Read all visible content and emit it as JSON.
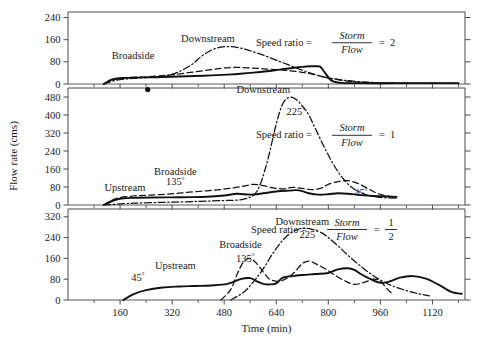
{
  "figure": {
    "y_axis_title": "Flow rate (cms)",
    "x_axis_title": "Time (min)"
  },
  "chart_data": {
    "type": "line",
    "title": "",
    "xlabel": "Time (min)",
    "ylabel": "Flow rate (cms)",
    "xlim": [
      0,
      1220
    ],
    "x_ticks_major": [
      160,
      320,
      480,
      640,
      800,
      960,
      1120
    ],
    "x_ticks_major_labels": [
      "160",
      "320",
      "480",
      "640",
      "800",
      "960",
      "1120"
    ],
    "x_ticks_minor": [
      80,
      240,
      400,
      560,
      720,
      880,
      1040,
      1200
    ],
    "grid": false,
    "legend": "inline-curve-labels",
    "line_styles": {
      "upstream": "solid",
      "broadside": "dashed",
      "downstream": "dash-dot"
    },
    "panels": [
      {
        "id": "panel-top",
        "annotation_prefix": "Speed ratio = ",
        "annotation_numerator": "Storm",
        "annotation_denominator": "Flow",
        "annotation_equals": "=",
        "annotation_value": "2",
        "annotation_value_is_fraction": false,
        "ylim": [
          0,
          260
        ],
        "y_ticks": [
          0,
          80,
          160,
          240
        ],
        "y_tick_labels": [
          "0",
          "80",
          "160",
          "240"
        ],
        "curve_labels": [
          {
            "text": "Broadside",
            "x": 200,
            "y": 92
          },
          {
            "text": "Downstream",
            "x": 430,
            "y": 150
          }
        ],
        "angle_labels": [],
        "series": [
          {
            "name": "Upstream",
            "style": "solid",
            "x": [
              110,
              130,
              150,
              175,
              200,
              240,
              290,
              340,
              390,
              440,
              490,
              530,
              570,
              610,
              650,
              690,
              720,
              745,
              760,
              775,
              790,
              810,
              840,
              900,
              1000,
              1100,
              1200
            ],
            "values": [
              0,
              14,
              20,
              22,
              23,
              24,
              25,
              27,
              29,
              31,
              34,
              37,
              41,
              46,
              52,
              58,
              62,
              64,
              64,
              62,
              40,
              12,
              4,
              3,
              3,
              3,
              3
            ]
          },
          {
            "name": "Broadside",
            "style": "dashed",
            "x": [
              110,
              140,
              170,
              200,
              240,
              290,
              340,
              390,
              440,
              480,
              520,
              560,
              600,
              640,
              680,
              720,
              760,
              800,
              850,
              900,
              980,
              1080,
              1200
            ],
            "values": [
              0,
              16,
              22,
              24,
              26,
              30,
              36,
              44,
              52,
              58,
              60,
              58,
              55,
              52,
              48,
              42,
              33,
              22,
              12,
              6,
              3,
              2,
              2
            ]
          },
          {
            "name": "Downstream",
            "style": "dash-dot",
            "x": [
              110,
              150,
              200,
              250,
              300,
              340,
              380,
              410,
              440,
              470,
              500,
              530,
              560,
              600,
              640,
              680,
              720,
              760,
              800,
              860,
              930,
              1020,
              1120,
              1200
            ],
            "values": [
              0,
              14,
              20,
              24,
              30,
              44,
              70,
              100,
              122,
              133,
              135,
              130,
              120,
              104,
              86,
              68,
              50,
              34,
              22,
              12,
              6,
              3,
              2,
              2
            ]
          }
        ]
      },
      {
        "id": "panel-middle",
        "annotation_prefix": "Speed ratio = ",
        "annotation_numerator": "Storm",
        "annotation_denominator": "Flow",
        "annotation_equals": "=",
        "annotation_value": "1",
        "annotation_value_is_fraction": false,
        "ylim": [
          0,
          520
        ],
        "y_ticks": [
          0,
          80,
          160,
          240,
          320,
          400,
          480
        ],
        "y_tick_labels": [
          "0",
          "80",
          "160",
          "240",
          "320",
          "400",
          "480"
        ],
        "curve_labels": [
          {
            "text": "Upstream",
            "x": 175,
            "y": 62
          },
          {
            "text": "Broadside",
            "x": 330,
            "y": 132
          },
          {
            "text": "Downstream",
            "x": 600,
            "y": 500
          }
        ],
        "angle_labels": [
          {
            "text": "135",
            "x": 330,
            "y": 88
          },
          {
            "text": "225",
            "x": 700,
            "y": 400
          },
          {
            "text": "45",
            "x": 900,
            "y": 40
          }
        ],
        "series": [
          {
            "name": "Upstream",
            "style": "solid",
            "x": [
              110,
              140,
              170,
              210,
              260,
              320,
              380,
              440,
              480,
              520,
              560,
              600,
              640,
              680,
              700,
              720,
              740,
              770,
              800,
              830,
              860,
              900,
              940,
              980,
              1010
            ],
            "values": [
              0,
              20,
              30,
              32,
              33,
              34,
              35,
              38,
              42,
              50,
              46,
              52,
              60,
              64,
              66,
              62,
              52,
              46,
              48,
              52,
              50,
              44,
              40,
              38,
              36
            ]
          },
          {
            "name": "Broadside",
            "style": "dashed",
            "x": [
              110,
              150,
              200,
              250,
              300,
              350,
              400,
              450,
              500,
              540,
              570,
              600,
              630,
              660,
              690,
              720,
              750,
              780,
              800,
              830,
              860,
              890,
              920,
              950,
              980,
              1010
            ],
            "values": [
              0,
              30,
              40,
              44,
              48,
              54,
              60,
              66,
              74,
              84,
              92,
              86,
              76,
              72,
              78,
              74,
              68,
              76,
              92,
              104,
              108,
              96,
              74,
              52,
              40,
              34
            ]
          },
          {
            "name": "Downstream",
            "style": "dash-dot",
            "x": [
              110,
              200,
              300,
              400,
              480,
              540,
              580,
              610,
              640,
              660,
              680,
              700,
              720,
              740,
              760,
              790,
              820,
              850,
              880,
              920,
              960,
              1010
            ],
            "values": [
              0,
              8,
              12,
              16,
              20,
              26,
              60,
              180,
              360,
              450,
              478,
              470,
              440,
              400,
              340,
              250,
              170,
              110,
              70,
              44,
              34,
              30
            ]
          }
        ]
      },
      {
        "id": "panel-bottom",
        "annotation_prefix": "Speed ratio = ",
        "annotation_numerator": "Storm",
        "annotation_denominator": "Flow",
        "annotation_equals": "=",
        "annotation_value": "1/2",
        "annotation_value_is_fraction": true,
        "annotation_value_num": "1",
        "annotation_value_den": "2",
        "ylim": [
          0,
          350
        ],
        "y_ticks": [
          0,
          80,
          160,
          240,
          320
        ],
        "y_tick_labels": [
          "0",
          "80",
          "160",
          "240",
          "320"
        ],
        "curve_labels": [
          {
            "text": "Upstream",
            "x": 330,
            "y": 120
          },
          {
            "text": "Broadside",
            "x": 530,
            "y": 200
          },
          {
            "text": "Downstream",
            "x": 720,
            "y": 290
          }
        ],
        "angle_labels": [
          {
            "text": "45",
            "x": 215,
            "y": 75
          },
          {
            "text": "135",
            "x": 545,
            "y": 148
          },
          {
            "text": "225",
            "x": 740,
            "y": 240
          }
        ],
        "series": [
          {
            "name": "Upstream",
            "style": "solid",
            "x": [
              170,
              200,
              240,
              290,
              340,
              390,
              440,
              490,
              530,
              560,
              580,
              600,
              620,
              640,
              660,
              690,
              720,
              760,
              800,
              830,
              860,
              880,
              900,
              930,
              960,
              990,
              1020,
              1060,
              1100,
              1140,
              1180,
              1210
            ],
            "values": [
              0,
              22,
              38,
              48,
              52,
              54,
              56,
              62,
              80,
              84,
              72,
              62,
              60,
              64,
              86,
              92,
              96,
              100,
              104,
              118,
              122,
              116,
              100,
              80,
              66,
              72,
              86,
              92,
              82,
              58,
              30,
              24
            ]
          },
          {
            "name": "Broadside",
            "style": "dashed",
            "x": [
              470,
              500,
              520,
              540,
              560,
              580,
              600,
              620,
              650,
              680,
              700,
              720,
              740,
              760,
              790,
              820,
              850,
              880,
              910,
              940,
              960,
              980,
              1000
            ],
            "values": [
              0,
              40,
              100,
              148,
              160,
              140,
              108,
              80,
              72,
              90,
              112,
              140,
              150,
              140,
              120,
              96,
              74,
              60,
              68,
              80,
              72,
              44,
              20
            ]
          },
          {
            "name": "Downstream",
            "style": "dash-dot",
            "x": [
              500,
              540,
              570,
              600,
              630,
              660,
              690,
              720,
              750,
              780,
              800,
              830,
              860,
              890,
              920,
              950,
              990,
              1030,
              1070,
              1110
            ],
            "values": [
              0,
              30,
              70,
              120,
              180,
              230,
              262,
              276,
              272,
              258,
              240,
              208,
              172,
              140,
              110,
              84,
              58,
              40,
              26,
              16
            ]
          }
        ]
      }
    ]
  }
}
